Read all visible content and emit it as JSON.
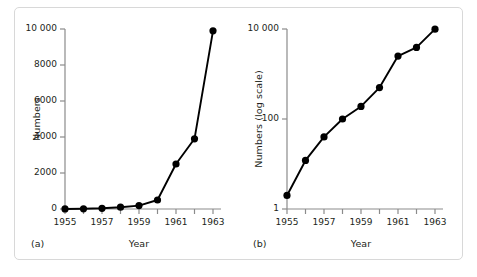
{
  "figure": {
    "panels": [
      {
        "tag": "(a)",
        "y_axis_title": "Numbers",
        "x_axis_title": "Year",
        "y_ticks": [
          "0",
          "2000",
          "4000",
          "6000",
          "8000",
          "10 000"
        ],
        "x_ticks": [
          "1955",
          "1957",
          "1959",
          "1961",
          "1963"
        ]
      },
      {
        "tag": "(b)",
        "y_axis_title": "Numbers (log scale)",
        "x_axis_title": "Year",
        "y_ticks": [
          "1",
          "100",
          "10 000"
        ],
        "x_ticks": [
          "1955",
          "1957",
          "1959",
          "1961",
          "1963"
        ]
      }
    ]
  },
  "chart_data": [
    {
      "type": "line",
      "title": "",
      "panel": "(a)",
      "xlabel": "Year",
      "ylabel": "Numbers",
      "x": [
        1955,
        1956,
        1957,
        1958,
        1959,
        1960,
        1961,
        1962,
        1963
      ],
      "values": [
        2,
        12,
        40,
        100,
        190,
        500,
        2500,
        3900,
        9900
      ],
      "xlim": [
        1955,
        1963
      ],
      "ylim": [
        0,
        10000
      ],
      "yscale": "linear",
      "y_tick_values": [
        0,
        2000,
        4000,
        6000,
        8000,
        10000
      ],
      "y_tick_labels": [
        "0",
        "2000",
        "4000",
        "6000",
        "8000",
        "10 000"
      ],
      "x_tick_values": [
        1955,
        1956,
        1957,
        1958,
        1959,
        1960,
        1961,
        1962,
        1963
      ],
      "x_tick_labels": [
        "1955",
        "",
        "1957",
        "",
        "1959",
        "",
        "1961",
        "",
        "1963"
      ],
      "grid": false,
      "legend": false,
      "marker": "filled-circle",
      "line_color": "#000000"
    },
    {
      "type": "line",
      "title": "",
      "panel": "(b)",
      "xlabel": "Year",
      "ylabel": "Numbers (log scale)",
      "x": [
        1955,
        1956,
        1957,
        1958,
        1959,
        1960,
        1961,
        1962,
        1963
      ],
      "values": [
        2,
        12,
        40,
        100,
        190,
        500,
        2500,
        3900,
        9900
      ],
      "xlim": [
        1955,
        1963
      ],
      "ylim": [
        1,
        10000
      ],
      "yscale": "log",
      "y_tick_values": [
        1,
        100,
        10000
      ],
      "y_tick_labels": [
        "1",
        "100",
        "10 000"
      ],
      "x_tick_values": [
        1955,
        1956,
        1957,
        1958,
        1959,
        1960,
        1961,
        1962,
        1963
      ],
      "x_tick_labels": [
        "1955",
        "",
        "1957",
        "",
        "1959",
        "",
        "1961",
        "",
        "1963"
      ],
      "grid": false,
      "legend": false,
      "marker": "filled-circle",
      "line_color": "#000000"
    }
  ]
}
